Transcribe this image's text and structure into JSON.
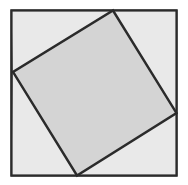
{
  "figure": {
    "canvas": {
      "width": 188,
      "height": 185,
      "background": "#ffffff"
    },
    "outer_square": {
      "name": "outer-square",
      "x": 11.5,
      "y": 10.5,
      "width": 165,
      "height": 165,
      "fill": "#e9e9e9",
      "stroke": "#2b2b2b",
      "stroke_width": 2.2,
      "corners": [
        [
          11.5,
          10.5
        ],
        [
          176.5,
          10.5
        ],
        [
          176.5,
          175.5
        ],
        [
          11.5,
          175.5
        ]
      ]
    },
    "inner_square": {
      "name": "inner-tilted-square",
      "fill": "#d4d4d4",
      "stroke": "#2b2b2b",
      "stroke_width": 2.4,
      "points": "113,10.5 176.5,113 77,175.5 13,72",
      "vertices": [
        {
          "label": "top",
          "x": 113,
          "y": 10.5
        },
        {
          "label": "right",
          "x": 176.5,
          "y": 113
        },
        {
          "label": "bottom",
          "x": 77,
          "y": 175.5
        },
        {
          "label": "left",
          "x": 13,
          "y": 72
        }
      ],
      "rotation_deg": 31.6
    },
    "corner_triangles": [
      {
        "name": "triangle-top-left",
        "points": "11.5,10.5 113,10.5 13,72",
        "fill": "#e9e9e9"
      },
      {
        "name": "triangle-top-right",
        "points": "113,10.5 176.5,10.5 176.5,113",
        "fill": "#e9e9e9"
      },
      {
        "name": "triangle-bottom-right",
        "points": "176.5,113 176.5,175.5 77,175.5",
        "fill": "#e9e9e9"
      },
      {
        "name": "triangle-bottom-left",
        "points": "77,175.5 11.5,175.5 13,72",
        "fill": "#e9e9e9"
      }
    ]
  }
}
